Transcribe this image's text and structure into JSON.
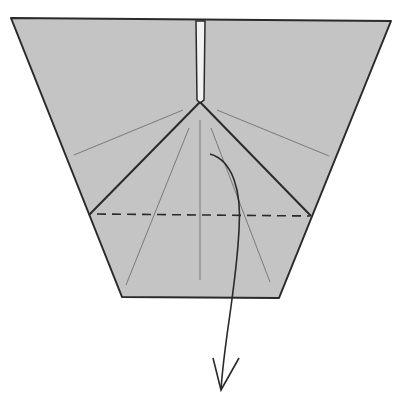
{
  "diagram": {
    "type": "origami-step",
    "colors": {
      "paper": "#c4c4c4",
      "outline": "#2a2a2a",
      "crease": "#7a7a7a",
      "slot": "#f2f2f2",
      "background": "#ffffff"
    },
    "shapes": {
      "paper_outline": "11,18 391,21 279,298 122,297",
      "slot": "196,21 205,21 204,100 200,103 197,100",
      "valley_fold_line": {
        "x1": 97,
        "y1": 214,
        "x2": 310,
        "y2": 216
      },
      "flap_left_edge": {
        "x1": 200,
        "y1": 102,
        "x2": 89,
        "y2": 215
      },
      "flap_right_edge": {
        "x1": 200,
        "y1": 102,
        "x2": 311,
        "y2": 216
      },
      "creases": [
        {
          "x1": 183,
          "y1": 110,
          "x2": 74,
          "y2": 155
        },
        {
          "x1": 217,
          "y1": 110,
          "x2": 329,
          "y2": 156
        },
        {
          "x1": 200,
          "y1": 120,
          "x2": 200,
          "y2": 280
        },
        {
          "x1": 189,
          "y1": 128,
          "x2": 126,
          "y2": 285
        },
        {
          "x1": 211,
          "y1": 128,
          "x2": 270,
          "y2": 282
        }
      ],
      "fold_arrow": {
        "path": "M210,154 C232,160 242,190 239,230 C236,290 224,340 221,390",
        "head": "213,358 221,390 239,358"
      }
    },
    "instruction": "valley-fold-down"
  }
}
